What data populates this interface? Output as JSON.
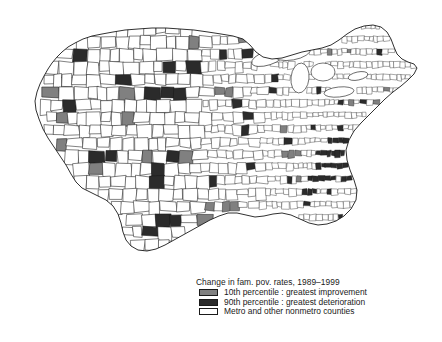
{
  "figure": {
    "type": "choropleth-map",
    "region": "continental-united-states",
    "unit": "county"
  },
  "legend": {
    "title": "Change in fam. pov. rates, 1989–1999",
    "entries": [
      {
        "swatch": "gray",
        "color": "#808080",
        "label": "10th percentile : greatest improvement"
      },
      {
        "swatch": "black",
        "color": "#2b2b2b",
        "label": "90th percentile : greatest deterioration"
      },
      {
        "swatch": "white",
        "color": "#ffffff",
        "label": "Metro and other nonmetro counties"
      }
    ]
  },
  "colors": {
    "outline": "#1a1a1a",
    "background": "#ffffff",
    "improvement": "#808080",
    "deterioration": "#2b2b2b",
    "other": "#ffffff"
  },
  "chart_data": {
    "type": "heatmap",
    "title": "Change in fam. pov. rates, 1989–1999",
    "xlabel": "",
    "ylabel": "",
    "categories": [
      "10th percentile : greatest improvement",
      "90th percentile : greatest deterioration",
      "Metro and other nonmetro counties"
    ],
    "values": [
      311,
      311,
      2519
    ],
    "grid": false,
    "legend_position": "bottom-center"
  },
  "map_geometry": {
    "comment": "Normalized continental-US outline and interior county grid. Coordinates are in the 442x290 map viewport.",
    "outline": "M 36 96 L 38 88 L 44 78 L 49 70 L 54 62 L 60 56 L 66 50 L 74 44 L 84 39 L 96 35 L 110 32 L 124 30 L 140 29 L 158 29 L 176 30 L 196 32 L 214 34 L 232 36 L 248 38 L 258 44 L 266 52 L 276 58 L 288 58 L 300 55 L 312 52 L 324 50 L 336 48 L 346 44 L 354 38 L 362 32 L 370 28 L 378 26 L 386 28 L 392 34 L 396 42 L 400 50 L 404 56 L 410 60 L 416 62 L 420 66 L 418 72 L 412 78 L 406 84 L 398 90 L 390 96 L 382 104 L 374 112 L 366 120 L 358 128 L 352 136 L 348 146 L 346 156 L 348 166 L 352 176 L 356 186 L 358 196 L 356 206 L 350 214 L 342 220 L 334 224 L 326 226 L 318 226 L 310 224 L 302 220 L 294 216 L 286 214 L 278 214 L 270 216 L 262 218 L 254 218 L 246 216 L 238 214 L 230 214 L 222 216 L 214 220 L 206 224 L 198 228 L 190 232 L 182 236 L 174 240 L 166 244 L 158 248 L 150 250 L 142 250 L 134 248 L 128 244 L 124 238 L 122 230 L 120 222 L 118 214 L 114 206 L 108 200 L 100 196 L 92 192 L 84 188 L 78 182 L 74 174 L 70 166 L 64 158 L 58 150 L 52 142 L 46 134 L 42 126 L 38 116 L 36 106 Z",
    "county_count": 3141,
    "density_regions": [
      {
        "name": "west",
        "x_range": [
          20,
          200
        ],
        "cell_size": 13
      },
      {
        "name": "plains",
        "x_range": [
          200,
          270
        ],
        "cell_size": 9
      },
      {
        "name": "east",
        "x_range": [
          270,
          430
        ],
        "cell_size": 5.5
      }
    ]
  }
}
